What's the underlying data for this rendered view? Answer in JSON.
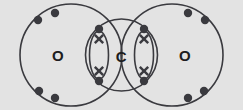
{
  "figure": {
    "kind": "dot-and-cross-diagram",
    "molecule": "carbon dioxide",
    "background_color": "#e3e3e3",
    "stroke_color": "#3a3a3f",
    "label_color": "#1d1d20",
    "width": 243,
    "height": 110
  },
  "atoms": [
    {
      "id": "oxygen-left",
      "label": "O",
      "cx": 71,
      "cy": 55,
      "r": 51,
      "label_x": 58,
      "label_y": 55
    },
    {
      "id": "carbon-center",
      "label": "C",
      "cx": 121.5,
      "cy": 55,
      "r": 36,
      "label_x": 121.5,
      "label_y": 56
    },
    {
      "id": "oxygen-right",
      "label": "O",
      "cx": 172,
      "cy": 55,
      "r": 51,
      "label_x": 185,
      "label_y": 55
    }
  ],
  "lone_pairs": [
    {
      "id": "lone-pair-left-top",
      "atom": "oxygen-left",
      "dots": [
        {
          "x": 38,
          "y": 20
        },
        {
          "x": 55,
          "y": 13
        }
      ]
    },
    {
      "id": "lone-pair-left-bottom",
      "atom": "oxygen-left",
      "dots": [
        {
          "x": 39,
          "y": 91
        },
        {
          "x": 55,
          "y": 98
        }
      ]
    },
    {
      "id": "lone-pair-right-top",
      "atom": "oxygen-right",
      "dots": [
        {
          "x": 188,
          "y": 13
        },
        {
          "x": 205,
          "y": 20
        }
      ]
    },
    {
      "id": "lone-pair-right-bottom",
      "atom": "oxygen-right",
      "dots": [
        {
          "x": 188,
          "y": 98
        },
        {
          "x": 204,
          "y": 91
        }
      ]
    }
  ],
  "bonds": [
    {
      "id": "bond-left-double",
      "between": [
        "oxygen-left",
        "carbon-center"
      ],
      "type": "double",
      "lens": {
        "cx": 99,
        "cy": 55,
        "rx": 9.5,
        "ry": 24
      },
      "shared_pairs": [
        {
          "id": "bond-left-upper-pair",
          "dot": {
            "x": 99,
            "y": 29
          },
          "cross": {
            "x": 99,
            "y": 39
          }
        },
        {
          "id": "bond-left-lower-pair",
          "dot": {
            "x": 99,
            "y": 81
          },
          "cross": {
            "x": 99,
            "y": 71
          }
        }
      ]
    },
    {
      "id": "bond-right-double",
      "between": [
        "carbon-center",
        "oxygen-right"
      ],
      "type": "double",
      "lens": {
        "cx": 144,
        "cy": 55,
        "rx": 9.5,
        "ry": 24
      },
      "shared_pairs": [
        {
          "id": "bond-right-upper-pair",
          "dot": {
            "x": 144,
            "y": 29
          },
          "cross": {
            "x": 144,
            "y": 39
          }
        },
        {
          "id": "bond-right-lower-pair",
          "dot": {
            "x": 144,
            "y": 81
          },
          "cross": {
            "x": 144,
            "y": 71
          }
        }
      ]
    }
  ],
  "geometry": {
    "dot_radius": 4.2,
    "cross_arm": 4.2
  }
}
